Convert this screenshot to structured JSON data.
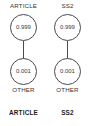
{
  "figure": {
    "type": "two-column-node-diagram",
    "background_color": "#ffffff",
    "stroke_color": "#4a4a4a",
    "text_color": "#333333"
  },
  "columns": [
    {
      "key": "article",
      "top_label": "ARTICLE",
      "bottom_label": "OTHER",
      "caption": "ARTICLE",
      "nodes": [
        {
          "position": "upper",
          "value": "0.999"
        },
        {
          "position": "lower",
          "value": "0.001"
        }
      ]
    },
    {
      "key": "ss2",
      "top_label": "SS2",
      "bottom_label": "OTHER",
      "caption": "SS2",
      "nodes": [
        {
          "position": "upper",
          "value": "0.999"
        },
        {
          "position": "lower",
          "value": "0.001"
        }
      ]
    }
  ],
  "chart_data": {
    "type": "diagram",
    "title": "",
    "categories": [
      "ARTICLE",
      "SS2"
    ],
    "series": [
      {
        "name": "top state probability",
        "values": [
          0.999,
          0.999
        ]
      },
      {
        "name": "bottom state probability",
        "values": [
          0.001,
          0.001
        ]
      }
    ],
    "node_labels": [
      "ARTICLE",
      "OTHER",
      "SS2",
      "OTHER"
    ],
    "annotations": [
      "ARTICLE",
      "SS2"
    ]
  }
}
